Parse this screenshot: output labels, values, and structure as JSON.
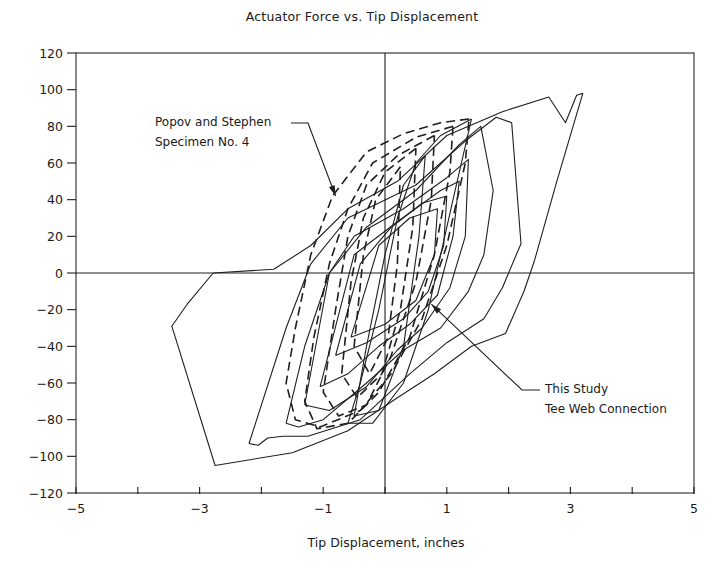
{
  "chart_data": {
    "type": "line",
    "title": "Actuator Force vs. Tip Displacement",
    "xlabel": "Tip Displacement, inches",
    "ylabel": "",
    "xlim": [
      -5,
      5
    ],
    "ylim": [
      -120,
      120
    ],
    "x_ticks": [
      -5,
      -4,
      -3,
      -2,
      -1,
      0,
      1,
      2,
      3,
      4,
      5
    ],
    "x_tick_labels": [
      "-5",
      "",
      "-3",
      "",
      "-1",
      "",
      "1",
      "",
      "3",
      "",
      "5"
    ],
    "y_ticks": [
      120,
      100,
      80,
      60,
      40,
      20,
      0,
      -20,
      -40,
      -60,
      -80,
      -100,
      -120
    ],
    "y_tick_labels": [
      "120",
      "100",
      "80",
      "60",
      "40",
      "20",
      "0",
      "−20",
      "−40",
      "−60",
      "−80",
      "−100",
      "−120"
    ],
    "grid": false,
    "zero_lines": true,
    "annotations": [
      {
        "id": "popov",
        "lines": [
          "Popov and Stephen",
          "Specimen No. 4"
        ],
        "arrow_to": [
          -0.8,
          42
        ]
      },
      {
        "id": "study",
        "lines": [
          "This Study",
          "Tee Web Connection"
        ],
        "arrow_to": [
          0.75,
          -17
        ]
      }
    ],
    "series": [
      {
        "name": "This Study - Tee Web Connection",
        "style": "solid",
        "loops": [
          [
            [
              -2.78,
              0
            ],
            [
              -3.2,
              -17
            ],
            [
              -3.45,
              -29
            ],
            [
              -2.75,
              -105
            ],
            [
              -1.5,
              -98
            ],
            [
              -0.6,
              -86
            ],
            [
              0.2,
              -68
            ],
            [
              0.8,
              -55
            ],
            [
              1.4,
              -40
            ],
            [
              1.95,
              -33
            ],
            [
              2.25,
              -10
            ],
            [
              2.42,
              7
            ],
            [
              2.78,
              50
            ],
            [
              3.2,
              98
            ],
            [
              3.1,
              97
            ],
            [
              2.92,
              82
            ],
            [
              2.65,
              96
            ],
            [
              1.9,
              88
            ],
            [
              1.0,
              75
            ],
            [
              0.2,
              50
            ],
            [
              -0.6,
              35
            ],
            [
              -1.2,
              15
            ],
            [
              -1.8,
              2
            ],
            [
              -2.78,
              0
            ]
          ],
          [
            [
              -2.2,
              -93
            ],
            [
              -2.05,
              -94
            ],
            [
              -1.9,
              -90
            ],
            [
              -1.65,
              -89
            ],
            [
              -1.25,
              -89
            ],
            [
              -0.4,
              -80
            ],
            [
              0.4,
              -55
            ],
            [
              1.0,
              -38
            ],
            [
              1.6,
              -25
            ],
            [
              1.9,
              -8
            ],
            [
              2.2,
              16
            ],
            [
              2.05,
              82
            ],
            [
              1.8,
              85
            ],
            [
              1.3,
              72
            ],
            [
              0.5,
              48
            ],
            [
              -0.6,
              30
            ],
            [
              -1.2,
              5
            ],
            [
              -1.6,
              -30
            ],
            [
              -2.2,
              -93
            ]
          ],
          [
            [
              -1.6,
              -82
            ],
            [
              -1.4,
              -84
            ],
            [
              -1.0,
              -80
            ],
            [
              -0.3,
              -60
            ],
            [
              0.3,
              -42
            ],
            [
              0.9,
              -30
            ],
            [
              1.35,
              -10
            ],
            [
              1.6,
              10
            ],
            [
              1.75,
              45
            ],
            [
              1.55,
              80
            ],
            [
              1.2,
              70
            ],
            [
              0.5,
              45
            ],
            [
              -0.3,
              25
            ],
            [
              -0.9,
              0
            ],
            [
              -1.3,
              -40
            ],
            [
              -1.6,
              -82
            ]
          ],
          [
            [
              -1.3,
              -72
            ],
            [
              -0.9,
              -75
            ],
            [
              -0.3,
              -62
            ],
            [
              0.2,
              -42
            ],
            [
              0.6,
              -30
            ],
            [
              1.05,
              -8
            ],
            [
              1.3,
              20
            ],
            [
              1.35,
              62
            ],
            [
              1.0,
              52
            ],
            [
              0.3,
              35
            ],
            [
              -0.5,
              20
            ],
            [
              -0.9,
              0
            ],
            [
              -1.3,
              -72
            ]
          ],
          [
            [
              -1.05,
              -62
            ],
            [
              -0.6,
              -55
            ],
            [
              -0.1,
              -40
            ],
            [
              0.4,
              -28
            ],
            [
              0.85,
              -12
            ],
            [
              1.1,
              20
            ],
            [
              1.2,
              50
            ],
            [
              0.9,
              45
            ],
            [
              0.2,
              28
            ],
            [
              -0.5,
              10
            ],
            [
              -1.05,
              -62
            ]
          ],
          [
            [
              -0.8,
              -45
            ],
            [
              -0.3,
              -38
            ],
            [
              0.3,
              -25
            ],
            [
              0.7,
              -10
            ],
            [
              0.95,
              15
            ],
            [
              1.0,
              42
            ],
            [
              0.6,
              38
            ],
            [
              0.1,
              25
            ],
            [
              -0.4,
              5
            ],
            [
              -0.8,
              -45
            ]
          ],
          [
            [
              -0.55,
              -35
            ],
            [
              0.0,
              -28
            ],
            [
              0.5,
              -15
            ],
            [
              0.8,
              10
            ],
            [
              0.85,
              35
            ],
            [
              0.4,
              30
            ],
            [
              -0.1,
              15
            ],
            [
              -0.55,
              -35
            ]
          ],
          [
            [
              1.4,
              84
            ],
            [
              0.9,
              75
            ],
            [
              0.5,
              60
            ],
            [
              0.2,
              30
            ],
            [
              -0.1,
              -20
            ],
            [
              -0.4,
              -60
            ],
            [
              -0.6,
              -82
            ],
            [
              -0.2,
              -82
            ],
            [
              0.3,
              -60
            ],
            [
              0.7,
              -20
            ],
            [
              1.1,
              40
            ],
            [
              1.4,
              84
            ]
          ],
          [
            [
              0.65,
              64
            ],
            [
              0.3,
              48
            ],
            [
              0.0,
              10
            ],
            [
              -0.3,
              -40
            ],
            [
              -0.5,
              -78
            ],
            [
              -0.1,
              -75
            ],
            [
              0.3,
              -40
            ],
            [
              0.55,
              20
            ],
            [
              0.65,
              64
            ]
          ]
        ]
      },
      {
        "name": "Popov and Stephen - Specimen No. 4",
        "style": "dashed",
        "loops": [
          [
            [
              1.36,
              84
            ],
            [
              0.9,
              82
            ],
            [
              0.3,
              76
            ],
            [
              -0.3,
              66
            ],
            [
              -0.85,
              42
            ],
            [
              -1.2,
              10
            ],
            [
              -1.45,
              -30
            ],
            [
              -1.6,
              -60
            ],
            [
              -1.45,
              -80
            ],
            [
              -1.05,
              -84
            ],
            [
              -0.4,
              -75
            ],
            [
              0.1,
              -55
            ],
            [
              0.6,
              -25
            ],
            [
              1.0,
              15
            ],
            [
              1.3,
              60
            ],
            [
              1.36,
              84
            ]
          ],
          [
            [
              1.1,
              80
            ],
            [
              0.5,
              74
            ],
            [
              -0.2,
              60
            ],
            [
              -0.6,
              35
            ],
            [
              -0.9,
              5
            ],
            [
              -1.15,
              -35
            ],
            [
              -1.3,
              -70
            ],
            [
              -1.1,
              -85
            ],
            [
              -0.6,
              -82
            ],
            [
              -0.1,
              -65
            ],
            [
              0.4,
              -35
            ],
            [
              0.8,
              10
            ],
            [
              1.05,
              55
            ],
            [
              1.1,
              80
            ]
          ],
          [
            [
              0.8,
              75
            ],
            [
              0.2,
              64
            ],
            [
              -0.3,
              48
            ],
            [
              -0.6,
              20
            ],
            [
              -0.8,
              -20
            ],
            [
              -1.0,
              -65
            ],
            [
              -0.75,
              -78
            ],
            [
              -0.3,
              -72
            ],
            [
              0.1,
              -45
            ],
            [
              0.5,
              -5
            ],
            [
              0.75,
              40
            ],
            [
              0.8,
              75
            ]
          ],
          [
            [
              0.5,
              68
            ],
            [
              0.0,
              55
            ],
            [
              -0.35,
              30
            ],
            [
              -0.55,
              -5
            ],
            [
              -0.7,
              -55
            ],
            [
              -0.45,
              -68
            ],
            [
              -0.05,
              -55
            ],
            [
              0.25,
              -20
            ],
            [
              0.45,
              25
            ],
            [
              0.5,
              68
            ]
          ],
          [
            [
              0.25,
              58
            ],
            [
              -0.15,
              40
            ],
            [
              -0.35,
              10
            ],
            [
              -0.5,
              -40
            ],
            [
              -0.25,
              -55
            ],
            [
              0.05,
              -35
            ],
            [
              0.2,
              5
            ],
            [
              0.25,
              58
            ]
          ]
        ]
      }
    ]
  }
}
